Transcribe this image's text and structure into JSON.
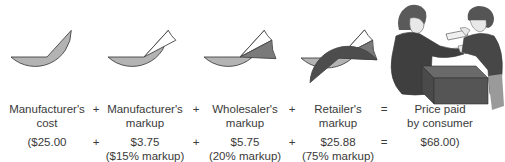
{
  "colors": {
    "cost": "#b3b3b3",
    "manufacturer_markup": "#ffffff",
    "wholesaler_markup": "#7a7a7a",
    "retailer_markup": "#4d4d4d",
    "outline": "#444444"
  },
  "chart_data": {
    "type": "pie",
    "title": "",
    "note": "Cumulative pie charts showing build-up of retail price from manufacturer's cost",
    "stages": [
      {
        "label": "Manufacturer's cost",
        "value": 25.0,
        "markup_pct": null
      },
      {
        "label": "Manufacturer's markup",
        "value": 3.75,
        "markup_pct": 15
      },
      {
        "label": "Wholesaler's markup",
        "value": 5.75,
        "markup_pct": 20
      },
      {
        "label": "Retailer's markup",
        "value": 25.88,
        "markup_pct": 75
      }
    ],
    "total": {
      "label": "Price paid by consumer",
      "value": 68.0
    },
    "pies": [
      {
        "cx": 47,
        "cy": 57,
        "r": 36,
        "slices": [
          "cost"
        ]
      },
      {
        "cx": 144,
        "cy": 57,
        "r": 36,
        "slices": [
          "cost",
          "manufacturer_markup"
        ]
      },
      {
        "cx": 240,
        "cy": 57,
        "r": 36,
        "slices": [
          "cost",
          "manufacturer_markup",
          "wholesaler_markup"
        ]
      },
      {
        "cx": 339,
        "cy": 58,
        "r": 38,
        "slices": [
          "cost",
          "manufacturer_markup",
          "wholesaler_markup",
          "retailer_markup"
        ]
      }
    ]
  },
  "columns": [
    {
      "title_line1": "Manufacturer's",
      "title_line2": "cost",
      "amount": "($25.00",
      "note": ""
    },
    {
      "title_line1": "Manufacturer's",
      "title_line2": "markup",
      "amount": "$3.75",
      "note": "($15% markup)"
    },
    {
      "title_line1": "Wholesaler's",
      "title_line2": "markup",
      "amount": "$5.75",
      "note": "(20% markup)"
    },
    {
      "title_line1": "Retailer's",
      "title_line2": "markup",
      "amount": "$25.88",
      "note": "(75% markup)"
    },
    {
      "title_line1": "Price paid",
      "title_line2": "by consumer",
      "amount": "$68.00)",
      "note": ""
    }
  ],
  "operators": {
    "plus": "+",
    "equals": "="
  },
  "illustration": {
    "description": "Customer paying cashier across a counter"
  }
}
